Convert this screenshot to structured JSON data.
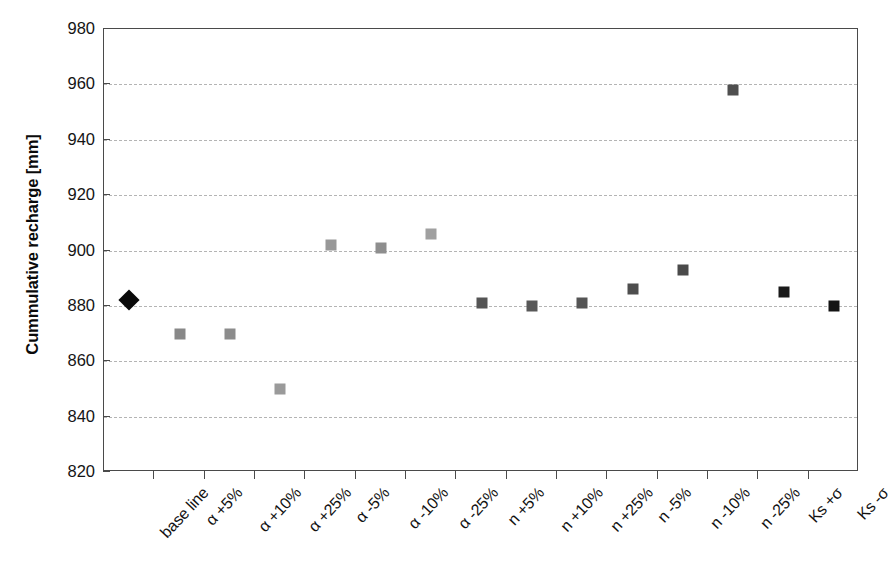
{
  "chart_data": {
    "type": "scatter",
    "title": "",
    "xlabel": "",
    "ylabel": "Cummulative recharge [mm]",
    "ylim": [
      820,
      980
    ],
    "ytick_step": 20,
    "yticks": [
      980,
      960,
      940,
      920,
      900,
      880,
      860,
      840,
      820
    ],
    "grid": true,
    "grid_style": "dashed",
    "grid_axis": "y",
    "legend": "none",
    "categories": [
      "base line",
      "α +5%",
      "α +10%",
      "α +25%",
      "α -5%",
      "α -10%",
      "α -25%",
      "n +5%",
      "n +10%",
      "n +25%",
      "n -5%",
      "n -10%",
      "n -25%",
      "Ks +σ",
      "Ks -σ"
    ],
    "values": [
      882,
      870,
      870,
      850,
      902,
      901,
      906,
      881,
      880,
      881,
      886,
      893,
      958,
      885,
      880
    ],
    "points": [
      {
        "category": "base line",
        "value": 882,
        "marker": "diamond",
        "color": "#0a0a0a"
      },
      {
        "category": "α +5%",
        "value": 870,
        "marker": "square",
        "color": "#888888"
      },
      {
        "category": "α +10%",
        "value": 870,
        "marker": "square",
        "color": "#8c8c8c"
      },
      {
        "category": "α +25%",
        "value": 850,
        "marker": "square",
        "color": "#9a9a9a"
      },
      {
        "category": "α -5%",
        "value": 902,
        "marker": "square",
        "color": "#989898"
      },
      {
        "category": "α -10%",
        "value": 901,
        "marker": "square",
        "color": "#8e8e8e"
      },
      {
        "category": "α -25%",
        "value": 906,
        "marker": "square",
        "color": "#a0a0a0"
      },
      {
        "category": "n +5%",
        "value": 881,
        "marker": "square",
        "color": "#555555"
      },
      {
        "category": "n +10%",
        "value": 880,
        "marker": "square",
        "color": "#585858"
      },
      {
        "category": "n +25%",
        "value": 881,
        "marker": "square",
        "color": "#555555"
      },
      {
        "category": "n -5%",
        "value": 886,
        "marker": "square",
        "color": "#4e4e4e"
      },
      {
        "category": "n -10%",
        "value": 893,
        "marker": "square",
        "color": "#4a4a4a"
      },
      {
        "category": "n -25%",
        "value": 958,
        "marker": "square",
        "color": "#4f4f4f"
      },
      {
        "category": "Ks +σ",
        "value": 885,
        "marker": "square",
        "color": "#1a1a1a"
      },
      {
        "category": "Ks -σ",
        "value": 880,
        "marker": "square",
        "color": "#141414"
      }
    ],
    "colors": {
      "baseline": "#0a0a0a",
      "alpha_series": "#909090",
      "n_series": "#515151",
      "ks_series": "#161616",
      "axis": "#4a4a4a",
      "gridline": "#b4b4b4",
      "text": "#121212"
    }
  }
}
